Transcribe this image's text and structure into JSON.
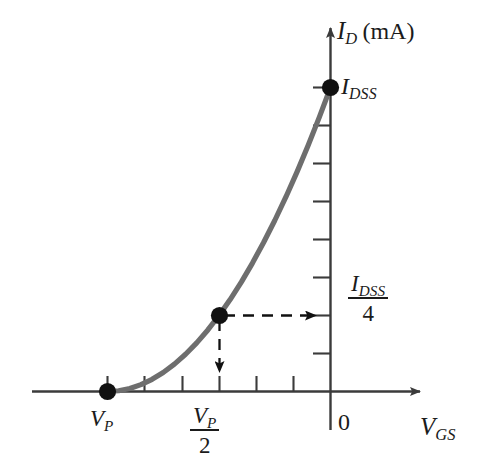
{
  "figure": {
    "background_color": "#ffffff",
    "axis_color": "#3b3b3b",
    "curve_color": "#6e6e6e",
    "marker_color": "#111111",
    "dashed_color": "#111111",
    "text_color": "#1b1b1b"
  },
  "labels": {
    "y_axis_symbol": "I",
    "y_axis_subscript": "D",
    "y_axis_unit": "(mA)",
    "idss_symbol": "I",
    "idss_subscript": "DSS",
    "idss_quarter_numerator_symbol": "I",
    "idss_quarter_numerator_subscript": "DSS",
    "idss_quarter_denominator": "4",
    "x_axis_symbol": "V",
    "x_axis_subscript": "GS",
    "origin": "0",
    "vp_symbol": "V",
    "vp_subscript": "P",
    "vp_half_numerator_symbol": "V",
    "vp_half_numerator_subscript": "P",
    "vp_half_denominator": "2"
  },
  "chart_data": {
    "type": "line",
    "xlabel": "V_GS",
    "ylabel": "I_D (mA)",
    "equation": "I_D = I_DSS (1 - V_GS / V_P)^2",
    "grid": false,
    "legend": false,
    "xlim": [
      -1.0,
      0.18
    ],
    "ylim": [
      0.0,
      1.12
    ],
    "x_axis_tick_count": 7,
    "y_axis_tick_count": 8,
    "annotated_points": [
      {
        "name": "pinch-off",
        "x_label": "V_P",
        "y_label": "0",
        "x": -1.0,
        "y": 0.0
      },
      {
        "name": "half-pinch-off",
        "x_label": "V_P/2",
        "y_label": "I_DSS/4",
        "x": -0.5,
        "y": 0.25
      },
      {
        "name": "saturation",
        "x_label": "0",
        "y_label": "I_DSS",
        "x": 0.0,
        "y": 1.0
      }
    ],
    "x": [
      -1.0,
      -0.95,
      -0.9,
      -0.85,
      -0.8,
      -0.75,
      -0.7,
      -0.65,
      -0.6,
      -0.55,
      -0.5,
      -0.45,
      -0.4,
      -0.35,
      -0.3,
      -0.25,
      -0.2,
      -0.15,
      -0.1,
      -0.05,
      0.0
    ],
    "values": [
      0.0,
      0.0025,
      0.01,
      0.0225,
      0.04,
      0.0625,
      0.09,
      0.1225,
      0.16,
      0.2025,
      0.25,
      0.3025,
      0.36,
      0.4225,
      0.49,
      0.5625,
      0.64,
      0.7225,
      0.81,
      0.9025,
      1.0
    ],
    "dashed_guides": [
      {
        "name": "horizontal-guide-to-idss-quarter",
        "from": [
          -0.5,
          0.25
        ],
        "to": [
          0.0,
          0.25
        ],
        "arrow": "right"
      },
      {
        "name": "vertical-guide-to-vp-half",
        "from": [
          -0.5,
          0.25
        ],
        "to": [
          -0.5,
          0.0
        ],
        "arrow": "down"
      }
    ]
  }
}
